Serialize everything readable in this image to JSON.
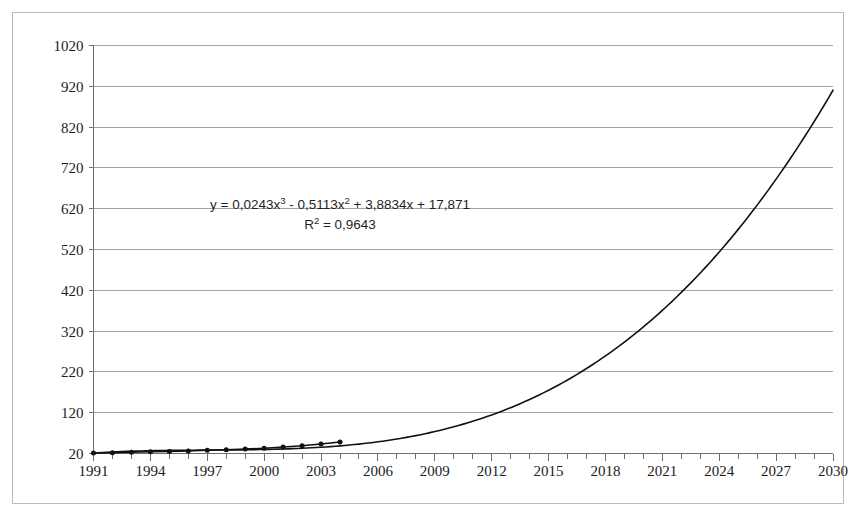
{
  "chart_data": {
    "type": "line",
    "title": "",
    "subtitle": "",
    "xlabel": "",
    "ylabel": "",
    "xlim": [
      1991,
      2030
    ],
    "ylim": [
      20,
      1020
    ],
    "grid": true,
    "legend": null,
    "x_tick_labels": [
      "1991",
      "1994",
      "1997",
      "2000",
      "2003",
      "2006",
      "2009",
      "2012",
      "2015",
      "2018",
      "2021",
      "2024",
      "2027",
      "2030"
    ],
    "x_tick_values": [
      1991,
      1994,
      1997,
      2000,
      2003,
      2006,
      2009,
      2012,
      2015,
      2018,
      2021,
      2024,
      2027,
      2030
    ],
    "x_minor_tick_step": 1,
    "y_tick_labels": [
      "20",
      "120",
      "220",
      "320",
      "420",
      "520",
      "620",
      "720",
      "820",
      "920",
      "1020"
    ],
    "y_tick_values": [
      20,
      120,
      220,
      320,
      420,
      520,
      620,
      720,
      820,
      920,
      1020
    ],
    "annotations": [
      {
        "name": "trendline-equation",
        "text": "y = 0,0243x³ - 0,5113x² + 3,8834x + 17,871",
        "parts": {
          "lead": "y = 0,0243x",
          "exp1": "3",
          "mid": " - 0,5113x",
          "exp2": "2",
          "tail": " + 3,8834x + 17,871"
        }
      },
      {
        "name": "r-squared",
        "text": "R² = 0,9643",
        "parts": {
          "lead": "R",
          "exp1": "2",
          "tail": " = 0,9643"
        }
      }
    ],
    "series": [
      {
        "name": "observed-data",
        "marker": "dot",
        "marker_color": "#111111",
        "line_color": "#111111",
        "x": [
          1991,
          1992,
          1993,
          1994,
          1995,
          1996,
          1997,
          1998,
          1999,
          2000,
          2001,
          2002,
          2003,
          2004
        ],
        "values": [
          21,
          22,
          23,
          24,
          25,
          26,
          28,
          29,
          31,
          33,
          36,
          39,
          43,
          48
        ]
      },
      {
        "name": "cubic-trendline",
        "marker": "none",
        "line_color": "#111111",
        "x": [
          1991,
          1992,
          1993,
          1994,
          1995,
          1996,
          1997,
          1998,
          1999,
          2000,
          2001,
          2002,
          2003,
          2004,
          2005,
          2006,
          2007,
          2008,
          2009,
          2010,
          2011,
          2012,
          2013,
          2014,
          2015,
          2016,
          2017,
          2018,
          2019,
          2020,
          2021,
          2022,
          2023,
          2024,
          2025,
          2026,
          2027,
          2028,
          2029,
          2030
        ],
        "values": [
          21,
          22,
          22,
          23,
          24,
          25,
          26,
          28,
          30,
          33,
          36,
          40,
          45,
          51,
          58,
          67,
          77,
          89,
          103,
          119,
          137,
          158,
          182,
          209,
          239,
          273,
          311,
          353,
          399,
          450,
          506,
          566,
          632,
          704,
          781,
          864,
          953,
          1049,
          1151,
          1260
        ]
      }
    ],
    "colors": {
      "line": "#111111",
      "grid": "#9a9a9a",
      "axis": "#6e6e6e",
      "border": "#b9b9b9",
      "background": "#ffffff",
      "text": "#1c1c1c"
    }
  }
}
